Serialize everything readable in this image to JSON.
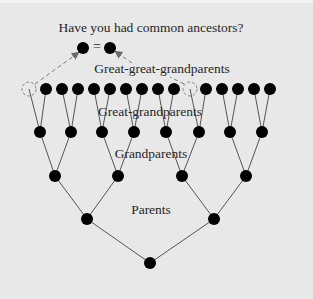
{
  "title": "Have you had common ancestors?",
  "labels": {
    "great_great_grandparents": "Great-great-grandparents",
    "great_grandparents": "Great-grandparents",
    "grandparents": "Grandparents",
    "parents": "Parents"
  },
  "equals_sign": "=",
  "colors": {
    "background": "#e8e8e8",
    "node": "#000000",
    "edge": "#555555",
    "dashed": "#8a8a8a",
    "text": "#262626"
  },
  "tree": {
    "node_radius": 6,
    "levels": [
      {
        "name": "great-great-grandparents",
        "y": 89,
        "x": [
          29,
          46,
          62,
          78,
          94,
          110,
          126,
          142,
          158,
          174,
          190,
          206,
          222,
          238,
          254,
          270
        ],
        "dashed": [
          0,
          10
        ]
      },
      {
        "name": "great-grandparents",
        "y": 132,
        "x": [
          40,
          71,
          102,
          134,
          166,
          199,
          230,
          262
        ]
      },
      {
        "name": "grandparents",
        "y": 176,
        "x": [
          55,
          118,
          182,
          246
        ]
      },
      {
        "name": "parents",
        "y": 219,
        "x": [
          87,
          214
        ]
      },
      {
        "name": "self",
        "y": 263,
        "x": [
          150
        ]
      }
    ],
    "common_ancestors": [
      {
        "x": 83,
        "y": 48
      },
      {
        "x": 110,
        "y": 48
      }
    ]
  }
}
